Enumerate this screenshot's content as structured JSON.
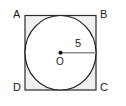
{
  "figure": {
    "type": "geometry-diagram",
    "colors": {
      "background": "#ffffff",
      "square_fill": "#f0f0f0",
      "square_stroke": "#2b2b2b",
      "circle_fill": "#ffffff",
      "circle_stroke": "#1b1b1b",
      "radius_line": "#8c8c8c",
      "center_dot": "#111111",
      "text": "#1b1b1b"
    },
    "square": {
      "vertices": [
        {
          "name": "A",
          "label": "A",
          "position": "top-left"
        },
        {
          "name": "B",
          "label": "B",
          "position": "top-right"
        },
        {
          "name": "C",
          "label": "C",
          "position": "bottom-right"
        },
        {
          "name": "D",
          "label": "D",
          "position": "bottom-left"
        }
      ]
    },
    "circle": {
      "center_label": "O",
      "radius_label": "5",
      "inscribed": true
    }
  }
}
